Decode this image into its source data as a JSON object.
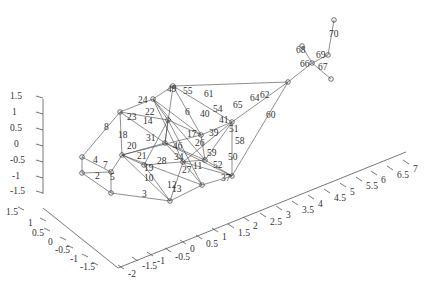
{
  "figure": {
    "type": "3d-graph-plot",
    "width": 437,
    "height": 284
  },
  "axes": {
    "z": {
      "ticks": [
        "1.5",
        "1",
        "0.5",
        "0",
        "-0.5",
        "-1",
        "-1.5"
      ],
      "tick_px": [
        [
          10,
          99
        ],
        [
          12,
          115
        ],
        [
          10,
          131
        ],
        [
          14,
          147
        ],
        [
          10,
          163
        ],
        [
          12,
          179
        ],
        [
          10,
          194
        ]
      ],
      "line": [
        [
          43,
          99
        ],
        [
          43,
          194
        ]
      ]
    },
    "y": {
      "ticks": [
        "1.5",
        "1",
        "0.5",
        "0",
        "-0.5",
        "-1",
        "-1.5"
      ],
      "tick_px": [
        [
          6,
          215
        ],
        [
          28,
          226
        ],
        [
          32,
          236
        ],
        [
          48,
          245
        ],
        [
          55,
          253
        ],
        [
          70,
          262
        ],
        [
          80,
          270
        ]
      ],
      "line": [
        [
          43,
          208
        ],
        [
          118,
          268
        ]
      ]
    },
    "x": {
      "ticks": [
        "-2",
        "-1.5",
        "-1",
        "-0.5",
        "0",
        "0.5",
        "1",
        "1.5",
        "2",
        "2.5",
        "3",
        "3.5",
        "4",
        "4.5",
        "5",
        "5.5",
        "6",
        "6.5",
        "7"
      ],
      "tick_px": [
        [
          128,
          277
        ],
        [
          142,
          269
        ],
        [
          157,
          264
        ],
        [
          175,
          260
        ],
        [
          190,
          252
        ],
        [
          206,
          247
        ],
        [
          222,
          240
        ],
        [
          238,
          236
        ],
        [
          253,
          229
        ],
        [
          270,
          225
        ],
        [
          286,
          218
        ],
        [
          302,
          213
        ],
        [
          318,
          207
        ],
        [
          334,
          201
        ],
        [
          350,
          195
        ],
        [
          366,
          189
        ],
        [
          381,
          183
        ],
        [
          397,
          178
        ],
        [
          413,
          172
        ]
      ],
      "line": [
        [
          118,
          268
        ],
        [
          406,
          152
        ]
      ]
    }
  },
  "graph": {
    "nodes": [
      {
        "id": "a",
        "x": 82,
        "y": 157
      },
      {
        "id": "b",
        "x": 82,
        "y": 173
      },
      {
        "id": "c",
        "x": 111,
        "y": 172
      },
      {
        "id": "d",
        "x": 111,
        "y": 193
      },
      {
        "id": "e",
        "x": 120,
        "y": 112
      },
      {
        "id": "f",
        "x": 153,
        "y": 99
      },
      {
        "id": "g",
        "x": 173,
        "y": 86
      },
      {
        "id": "h",
        "x": 122,
        "y": 155
      },
      {
        "id": "i",
        "x": 170,
        "y": 201
      },
      {
        "id": "j",
        "x": 202,
        "y": 185
      },
      {
        "id": "k",
        "x": 232,
        "y": 176
      },
      {
        "id": "l",
        "x": 232,
        "y": 122
      },
      {
        "id": "m",
        "x": 201,
        "y": 135
      },
      {
        "id": "n",
        "x": 168,
        "y": 120
      },
      {
        "id": "o",
        "x": 165,
        "y": 143
      },
      {
        "id": "p",
        "x": 183,
        "y": 162
      },
      {
        "id": "q",
        "x": 288,
        "y": 82
      },
      {
        "id": "r",
        "x": 312,
        "y": 63
      },
      {
        "id": "s",
        "x": 302,
        "y": 46
      },
      {
        "id": "t",
        "x": 331,
        "y": 79
      },
      {
        "id": "u",
        "x": 328,
        "y": 55
      },
      {
        "id": "v",
        "x": 334,
        "y": 20
      },
      {
        "id": "w",
        "x": 144,
        "y": 165
      },
      {
        "id": "x",
        "x": 205,
        "y": 160
      }
    ],
    "edges": [
      [
        "a",
        "b"
      ],
      [
        "a",
        "c"
      ],
      [
        "b",
        "c"
      ],
      [
        "c",
        "d"
      ],
      [
        "b",
        "d"
      ],
      [
        "a",
        "e"
      ],
      [
        "e",
        "f"
      ],
      [
        "f",
        "g"
      ],
      [
        "e",
        "h"
      ],
      [
        "h",
        "c"
      ],
      [
        "d",
        "i"
      ],
      [
        "h",
        "i"
      ],
      [
        "i",
        "j"
      ],
      [
        "j",
        "k"
      ],
      [
        "k",
        "l"
      ],
      [
        "l",
        "m"
      ],
      [
        "m",
        "g"
      ],
      [
        "g",
        "l"
      ],
      [
        "f",
        "n"
      ],
      [
        "n",
        "o"
      ],
      [
        "o",
        "h"
      ],
      [
        "o",
        "p"
      ],
      [
        "p",
        "j"
      ],
      [
        "p",
        "i"
      ],
      [
        "f",
        "m"
      ],
      [
        "n",
        "m"
      ],
      [
        "n",
        "j"
      ],
      [
        "o",
        "k"
      ],
      [
        "e",
        "o"
      ],
      [
        "f",
        "p"
      ],
      [
        "g",
        "o"
      ],
      [
        "l",
        "p"
      ],
      [
        "l",
        "q"
      ],
      [
        "k",
        "q"
      ],
      [
        "g",
        "q"
      ],
      [
        "q",
        "r"
      ],
      [
        "r",
        "s"
      ],
      [
        "r",
        "t"
      ],
      [
        "r",
        "u"
      ],
      [
        "u",
        "v"
      ],
      [
        "h",
        "w"
      ],
      [
        "w",
        "i"
      ],
      [
        "w",
        "x"
      ],
      [
        "x",
        "k"
      ],
      [
        "x",
        "m"
      ],
      [
        "f",
        "x"
      ],
      [
        "n",
        "w"
      ],
      [
        "o",
        "x"
      ],
      [
        "h",
        "m"
      ],
      [
        "e",
        "n"
      ],
      [
        "p",
        "k"
      ],
      [
        "h",
        "j"
      ],
      [
        "l",
        "x"
      ]
    ],
    "edge_labels": [
      {
        "t": "8",
        "x": 104,
        "y": 130
      },
      {
        "t": "4",
        "x": 93,
        "y": 163
      },
      {
        "t": "7",
        "x": 103,
        "y": 168
      },
      {
        "t": "2",
        "x": 95,
        "y": 179
      },
      {
        "t": "5",
        "x": 110,
        "y": 180
      },
      {
        "t": "3",
        "x": 142,
        "y": 197
      },
      {
        "t": "18",
        "x": 118,
        "y": 138
      },
      {
        "t": "20",
        "x": 127,
        "y": 149
      },
      {
        "t": "23",
        "x": 127,
        "y": 120
      },
      {
        "t": "24",
        "x": 138,
        "y": 103
      },
      {
        "t": "22",
        "x": 145,
        "y": 115
      },
      {
        "t": "49",
        "x": 167,
        "y": 92
      },
      {
        "t": "55",
        "x": 183,
        "y": 94
      },
      {
        "t": "61",
        "x": 204,
        "y": 97
      },
      {
        "t": "65",
        "x": 233,
        "y": 108
      },
      {
        "t": "54",
        "x": 213,
        "y": 112
      },
      {
        "t": "40",
        "x": 200,
        "y": 117
      },
      {
        "t": "6",
        "x": 185,
        "y": 115
      },
      {
        "t": "14",
        "x": 143,
        "y": 124
      },
      {
        "t": "31",
        "x": 146,
        "y": 141
      },
      {
        "t": "21",
        "x": 137,
        "y": 159
      },
      {
        "t": "19",
        "x": 144,
        "y": 171
      },
      {
        "t": "10",
        "x": 144,
        "y": 181
      },
      {
        "t": "12",
        "x": 167,
        "y": 188
      },
      {
        "t": "13",
        "x": 172,
        "y": 192
      },
      {
        "t": "28",
        "x": 157,
        "y": 164
      },
      {
        "t": "34",
        "x": 174,
        "y": 160
      },
      {
        "t": "46",
        "x": 173,
        "y": 149
      },
      {
        "t": "17",
        "x": 187,
        "y": 137
      },
      {
        "t": "39",
        "x": 209,
        "y": 136
      },
      {
        "t": "26",
        "x": 195,
        "y": 146
      },
      {
        "t": "59",
        "x": 207,
        "y": 156
      },
      {
        "t": "52",
        "x": 213,
        "y": 168
      },
      {
        "t": "50",
        "x": 228,
        "y": 160
      },
      {
        "t": "37",
        "x": 221,
        "y": 181
      },
      {
        "t": "58",
        "x": 235,
        "y": 144
      },
      {
        "t": "51",
        "x": 229,
        "y": 132
      },
      {
        "t": "41",
        "x": 219,
        "y": 123
      },
      {
        "t": "60",
        "x": 266,
        "y": 118
      },
      {
        "t": "64",
        "x": 250,
        "y": 101
      },
      {
        "t": "62",
        "x": 260,
        "y": 98
      },
      {
        "t": "66",
        "x": 300,
        "y": 67
      },
      {
        "t": "68",
        "x": 296,
        "y": 53
      },
      {
        "t": "69",
        "x": 316,
        "y": 58
      },
      {
        "t": "67",
        "x": 318,
        "y": 70
      },
      {
        "t": "70",
        "x": 329,
        "y": 37
      },
      {
        "t": "11",
        "x": 193,
        "y": 169
      },
      {
        "t": "27",
        "x": 182,
        "y": 173
      }
    ]
  }
}
